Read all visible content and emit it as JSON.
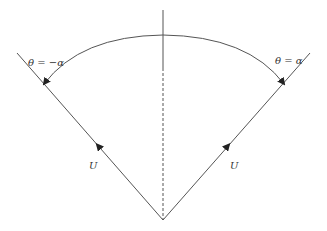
{
  "diagram": {
    "labels": {
      "theta_left": "θ = −α",
      "theta_right": "θ = α",
      "velocity_left": "U",
      "velocity_right": "U"
    },
    "colors": {
      "line": "#555555",
      "text": "#333333"
    }
  }
}
